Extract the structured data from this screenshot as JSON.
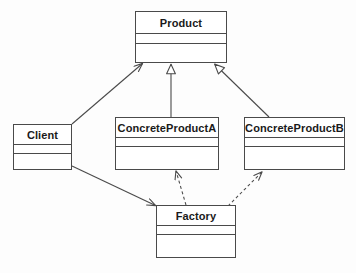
{
  "diagram": {
    "type": "uml-class-diagram",
    "canvas": {
      "width": 356,
      "height": 273,
      "background": "#fdfdfd"
    },
    "style": {
      "stroke": "#4a4a4a",
      "box_fill": "#ffffff",
      "text_color": "#1a1a1a"
    },
    "classes": [
      {
        "id": "product",
        "name": "Product",
        "x": 135,
        "y": 11,
        "width": 92,
        "height": 52,
        "name_h": 22,
        "attr_h": 10
      },
      {
        "id": "client",
        "name": "Client",
        "x": 13,
        "y": 124,
        "width": 59,
        "height": 46,
        "name_h": 20,
        "attr_h": 9
      },
      {
        "id": "concrete-product-a",
        "name": "ConcreteProductA",
        "x": 115,
        "y": 117,
        "width": 104,
        "height": 53,
        "name_h": 20,
        "attr_h": 9
      },
      {
        "id": "concrete-product-b",
        "name": "ConcreteProductB",
        "x": 244,
        "y": 117,
        "width": 101,
        "height": 53,
        "name_h": 20,
        "attr_h": 9
      },
      {
        "id": "factory",
        "name": "Factory",
        "x": 156,
        "y": 205,
        "width": 80,
        "height": 53,
        "name_h": 20,
        "attr_h": 9
      }
    ],
    "relationships": [
      {
        "id": "client-uses-product",
        "kind": "association",
        "line": "solid",
        "arrowhead": "open",
        "from": "client",
        "to": "product",
        "label": "Client → Product"
      },
      {
        "id": "concrete-product-a-extends-product",
        "kind": "generalization",
        "line": "solid",
        "arrowhead": "hollow-triangle",
        "from": "concrete-product-a",
        "to": "product",
        "label": "ConcreteProductA ▷ Product"
      },
      {
        "id": "concrete-product-b-extends-product",
        "kind": "generalization",
        "line": "solid",
        "arrowhead": "hollow-triangle",
        "from": "concrete-product-b",
        "to": "product",
        "label": "ConcreteProductB ▷ Product"
      },
      {
        "id": "client-uses-factory",
        "kind": "association",
        "line": "solid",
        "arrowhead": "open",
        "from": "client",
        "to": "factory",
        "label": "Client → Factory"
      },
      {
        "id": "factory-creates-concrete-product-a",
        "kind": "dependency",
        "line": "dashed",
        "arrowhead": "open",
        "from": "factory",
        "to": "concrete-product-a",
        "label": "Factory ⇢ ConcreteProductA"
      },
      {
        "id": "factory-creates-concrete-product-b",
        "kind": "dependency",
        "line": "dashed",
        "arrowhead": "open",
        "from": "factory",
        "to": "concrete-product-b",
        "label": "Factory ⇢ ConcreteProductB"
      }
    ]
  }
}
